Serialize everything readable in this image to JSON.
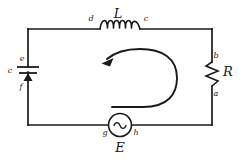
{
  "figure": {
    "kind": "circuit-diagram",
    "background_color": "#ffffff",
    "stroke_color": "#1a1a1a",
    "width": 240,
    "height": 159
  },
  "components": {
    "inductor": {
      "symbol_name": "inductor-coil",
      "label": "L",
      "left_node": "d",
      "right_node": "c",
      "turns": 6,
      "position": "top-wire"
    },
    "resistor": {
      "symbol_name": "resistor-zigzag",
      "label": "R",
      "top_node": "b",
      "bottom_node": "a",
      "position": "right-wire"
    },
    "capacitor": {
      "symbol_name": "capacitor-plates",
      "label": "c",
      "top_node": "e",
      "bottom_node": "f",
      "position": "left-wire"
    },
    "source": {
      "symbol_name": "ac-voltage-source",
      "label": "E",
      "glyph": "~",
      "left_node": "g",
      "right_node": "h",
      "position": "bottom-wire"
    }
  },
  "annotations": {
    "current_loop": {
      "symbol_name": "counterclockwise-current-arrow",
      "direction": "counterclockwise"
    }
  },
  "labels": {
    "L": "L",
    "R": "R",
    "E": "E",
    "a": "a",
    "b": "b",
    "c_inductor": "c",
    "c_capacitor": "c",
    "d": "d",
    "e": "e",
    "f": "f",
    "g": "g",
    "h": "h"
  }
}
